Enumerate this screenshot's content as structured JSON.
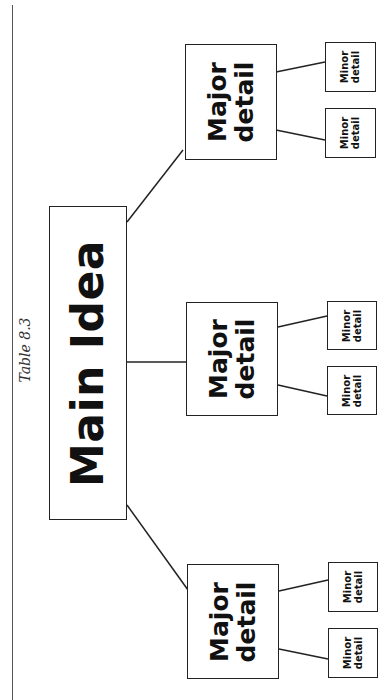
{
  "caption": "Table 8.3",
  "main": {
    "label": "Main Idea"
  },
  "majors": [
    {
      "line1": "Major",
      "line2": "detail",
      "minors": [
        {
          "line1": "Minor",
          "line2": "detail"
        },
        {
          "line1": "Minor",
          "line2": "detail"
        }
      ]
    },
    {
      "line1": "Major",
      "line2": "detail",
      "minors": [
        {
          "line1": "Minor",
          "line2": "detail"
        },
        {
          "line1": "Minor",
          "line2": "detail"
        }
      ]
    },
    {
      "line1": "Major",
      "line2": "detail",
      "minors": [
        {
          "line1": "Minor",
          "line2": "detail"
        },
        {
          "line1": "Minor",
          "line2": "detail"
        }
      ]
    }
  ],
  "colors": {
    "stroke": "#222222",
    "background": "#ffffff"
  }
}
